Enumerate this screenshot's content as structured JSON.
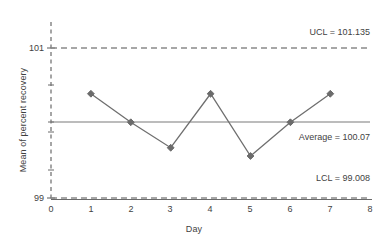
{
  "chart_data": {
    "type": "line",
    "title": "",
    "xlabel": "Day",
    "ylabel": "Mean of percent recovery",
    "x": [
      1,
      2,
      3,
      4,
      5,
      6,
      7
    ],
    "values": [
      100.39,
      100.01,
      99.67,
      100.39,
      99.56,
      100.01,
      100.39
    ],
    "series": [
      {
        "name": "Mean of percent recovery",
        "values": [
          100.39,
          100.01,
          99.67,
          100.39,
          99.56,
          100.01,
          100.39
        ]
      }
    ],
    "xlim": [
      0,
      8
    ],
    "ylim": [
      99,
      101.2
    ],
    "xticks": [
      "0",
      "1",
      "2",
      "3",
      "4",
      "5",
      "6",
      "7",
      "8"
    ],
    "yticks": [
      "101",
      "99"
    ],
    "ytick_values": [
      101,
      99
    ],
    "grid": false,
    "legend": "none",
    "marker": "diamond",
    "control_limits": {
      "ucl_value": 101.135,
      "ucl_label": "UCL = 101.135",
      "average_value": 100.07,
      "average_label": "Average = 100.07",
      "lcl_value": 99.008,
      "lcl_label": "LCL = 99.008"
    },
    "annotations": [
      "UCL = 101.135",
      "Average = 100.07",
      "LCL = 99.008"
    ],
    "colors": {
      "series_line": "#6f6f6f",
      "marker": "#6b6b6b",
      "average_line": "#7a7a7a",
      "limit_line": "#8a8a8a",
      "axis": "#6a6a6a",
      "text": "#3f3f3f",
      "background": "#ffffff"
    }
  },
  "axes": {
    "y_title": "Mean of percent recovery",
    "x_title": "Day",
    "x_tick_labels": [
      "0",
      "1",
      "2",
      "3",
      "4",
      "5",
      "6",
      "7",
      "8"
    ],
    "y_tick_labels": [
      "101",
      "99"
    ]
  },
  "labels": {
    "ucl": "UCL = 101.135",
    "average": "Average = 100.07",
    "lcl": "LCL = 99.008"
  }
}
